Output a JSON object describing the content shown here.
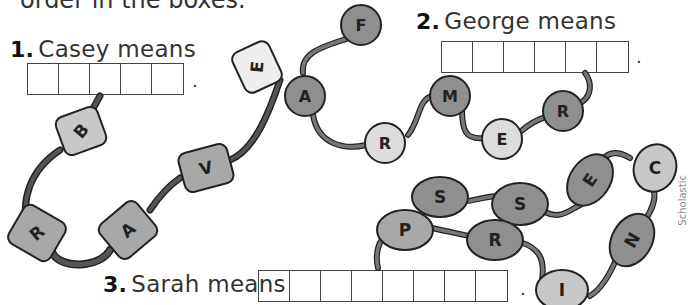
{
  "instructions_partial": "order in the boxes.",
  "questions": [
    {
      "number": "1.",
      "label": "Casey means",
      "box_count": 5,
      "bead_letters": [
        "E",
        "V",
        "A",
        "R",
        "B"
      ],
      "bead_shape": "barrel"
    },
    {
      "number": "2.",
      "label": "George means",
      "box_count": 6,
      "bead_letters": [
        "F",
        "A",
        "R",
        "M",
        "E",
        "R"
      ],
      "bead_shape": "round"
    },
    {
      "number": "3.",
      "label": "Sarah means",
      "box_count": 8,
      "bead_letters": [
        "S",
        "S",
        "E",
        "C",
        "N",
        "I",
        "R",
        "P"
      ],
      "bead_shape": "oval"
    }
  ],
  "period": ".",
  "credit": "Scholastic"
}
